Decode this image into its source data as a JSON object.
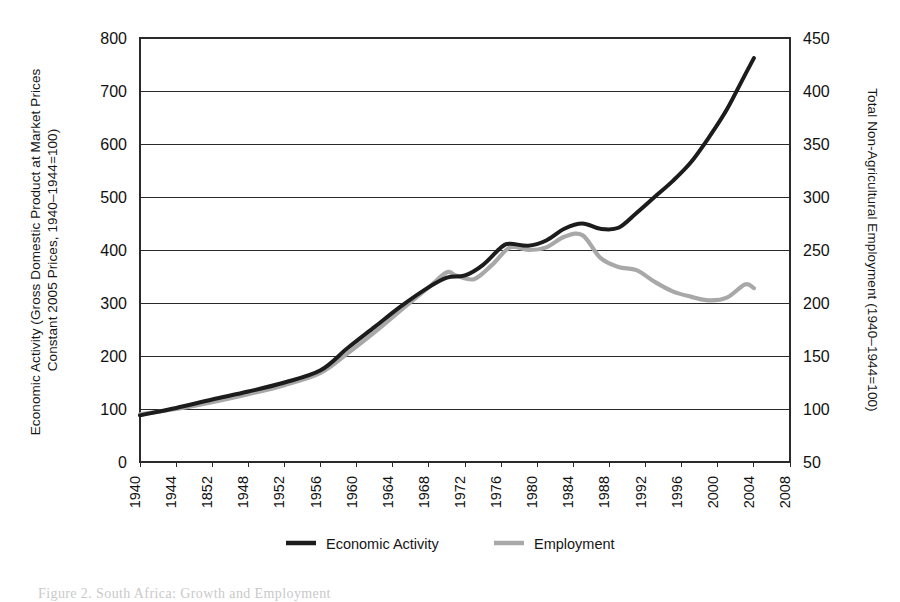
{
  "figure": {
    "caption": "Figure 2. South Africa: Growth and Employment"
  },
  "chart_data": {
    "type": "line",
    "title": "",
    "xlabel": "",
    "ylabel": "Economic Activity (Gross Domestic Product at Market Prices, Constant 2005 Prices, 1940–1944=100)",
    "y2label": "Total Non-Agricultural Employment (1940–1944=100)",
    "grid": true,
    "legend_position": "bottom",
    "xlim": [
      1940,
      2008
    ],
    "ylim": [
      0,
      800
    ],
    "y2lim": [
      50,
      450
    ],
    "yticks": [
      0,
      100,
      200,
      300,
      400,
      500,
      600,
      700,
      800
    ],
    "y2ticks": [
      50,
      100,
      150,
      200,
      250,
      300,
      350,
      400,
      450
    ],
    "xtick_labels": [
      "1940",
      "1944",
      "1852",
      "1948",
      "1952",
      "1956",
      "1960",
      "1964",
      "1968",
      "1972",
      "1976",
      "1980",
      "1984",
      "1988",
      "1992",
      "1996",
      "2000",
      "2004",
      "2008"
    ],
    "xticks": [
      1940,
      1944,
      1948,
      1952,
      1956,
      1960,
      1964,
      1968,
      1972,
      1976,
      1980,
      1984,
      1988,
      1992,
      1996,
      2000,
      2004,
      2008,
      2012
    ],
    "colors": {
      "economic_activity": "#1c1c1c",
      "employment": "#a8a8a8",
      "axis": "#2a2a2a",
      "background": "#ffffff"
    },
    "series": [
      {
        "name": "Economic Activity",
        "axis": "left",
        "color": "#1c1c1c",
        "x": [
          1940,
          1944,
          1948,
          1952,
          1956,
          1960,
          1963,
          1966,
          1969,
          1972,
          1974,
          1976,
          1978,
          1980,
          1981,
          1983,
          1985,
          1987,
          1989,
          1991,
          1993,
          1995,
          1997,
          1999,
          2001,
          2003,
          2005,
          2007,
          2008
        ],
        "values": [
          88,
          102,
          118,
          133,
          150,
          173,
          215,
          255,
          295,
          330,
          348,
          352,
          372,
          405,
          412,
          408,
          418,
          440,
          450,
          440,
          442,
          470,
          500,
          530,
          565,
          612,
          665,
          730,
          762
        ]
      },
      {
        "name": "Employment",
        "axis": "right",
        "color": "#a8a8a8",
        "x": [
          1940,
          1944,
          1948,
          1952,
          1956,
          1960,
          1963,
          1966,
          1969,
          1972,
          1974,
          1975,
          1977,
          1979,
          1981,
          1983,
          1985,
          1987,
          1989,
          1991,
          1993,
          1995,
          1997,
          1999,
          2001,
          2003,
          2005,
          2007,
          2008
        ],
        "values": [
          90,
          100,
          113,
          128,
          145,
          168,
          205,
          245,
          288,
          330,
          358,
          352,
          345,
          372,
          405,
          400,
          405,
          425,
          428,
          385,
          368,
          362,
          340,
          322,
          312,
          305,
          310,
          335,
          328
        ],
        "values_note": "Plotted against the right-hand axis; listed here in left-axis-equivalent plotting units."
      }
    ],
    "legend": [
      {
        "label": "Economic Activity",
        "color": "#1c1c1c"
      },
      {
        "label": "Employment",
        "color": "#a8a8a8"
      }
    ]
  }
}
